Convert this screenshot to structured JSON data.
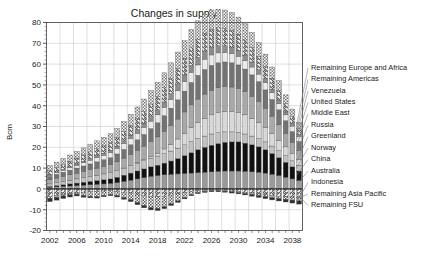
{
  "chart_data": {
    "type": "bar",
    "stacked": true,
    "title": "Changes in supply",
    "xlabel": "",
    "ylabel": "Bcm",
    "ylim": [
      -20,
      80
    ],
    "ytick_step": 10,
    "yticks": [
      "80",
      "70",
      "60",
      "50",
      "40",
      "30",
      "20",
      "10",
      "0",
      "-10",
      "-20"
    ],
    "grid": true,
    "legend_position": "right-callout",
    "categories": [
      "2002",
      "2003",
      "2004",
      "2005",
      "2006",
      "2007",
      "2008",
      "2009",
      "2010",
      "2011",
      "2012",
      "2013",
      "2014",
      "2015",
      "2016",
      "2017",
      "2018",
      "2019",
      "2020",
      "2021",
      "2022",
      "2023",
      "2024",
      "2025",
      "2026",
      "2027",
      "2028",
      "2029",
      "2030",
      "2031",
      "2032",
      "2033",
      "2034",
      "2035",
      "2036",
      "2037",
      "2038",
      "2039"
    ],
    "xtick_labels": [
      "2002",
      "2006",
      "2010",
      "2014",
      "2018",
      "2022",
      "2026",
      "2030",
      "2034",
      "2038"
    ],
    "series": [
      {
        "name": "Remaining FSU",
        "fill": "hatch-diag-up",
        "values": [
          -3.5,
          -3.2,
          -2.8,
          -2.4,
          -2.0,
          -1.6,
          -1.4,
          -1.2,
          -1.0,
          -0.9,
          -1.2,
          -1.6,
          -2.0,
          -2.6,
          -3.2,
          -3.6,
          -3.8,
          -3.6,
          -3.0,
          -2.4,
          -1.8,
          -1.2,
          -0.8,
          -0.6,
          -0.5,
          -0.6,
          -0.8,
          -1.0,
          -1.3,
          -1.6,
          -2.0,
          -2.4,
          -2.8,
          -3.2,
          -3.5,
          -3.8,
          -4.0,
          -4.2
        ]
      },
      {
        "name": "Remaining Asia Pacific",
        "fill": "hatch-check",
        "values": [
          -1.0,
          -0.8,
          -0.6,
          -0.5,
          -0.5,
          -1.6,
          -2.2,
          -2.6,
          -2.2,
          -1.8,
          -2.0,
          -2.6,
          -3.2,
          -4.0,
          -4.8,
          -5.4,
          -5.6,
          -5.0,
          -4.2,
          -3.4,
          -2.4,
          -1.6,
          -1.0,
          -0.6,
          -0.4,
          -0.3,
          -0.3,
          -0.4,
          -0.5,
          -0.6,
          -0.7,
          -0.8,
          -0.9,
          -1.0,
          -1.1,
          -1.2,
          -1.4,
          -1.6
        ]
      },
      {
        "name": "Indonesia",
        "fill": "solid-dark",
        "values": [
          -1.6,
          -1.4,
          -1.2,
          -1.0,
          -0.9,
          -0.8,
          -0.7,
          -0.6,
          -0.6,
          -0.6,
          -0.7,
          -0.8,
          -0.9,
          -1.0,
          -1.1,
          -1.1,
          -1.0,
          -0.9,
          -0.8,
          -0.7,
          -0.6,
          -0.5,
          -0.5,
          -0.5,
          -0.5,
          -0.5,
          -0.5,
          -0.6,
          -0.6,
          -0.7,
          -0.8,
          -0.9,
          -1.0,
          -1.1,
          -1.2,
          -1.3,
          -1.4,
          -1.5
        ]
      },
      {
        "name": "Australia",
        "fill": "gray-62",
        "values": [
          0.8,
          1.0,
          1.2,
          1.4,
          1.6,
          1.8,
          2.0,
          2.2,
          2.4,
          2.6,
          3.0,
          3.6,
          4.2,
          4.8,
          5.4,
          6.0,
          6.4,
          6.8,
          7.0,
          7.2,
          7.4,
          7.6,
          7.8,
          8.0,
          8.2,
          8.4,
          8.6,
          8.6,
          8.6,
          8.4,
          8.2,
          8.0,
          7.6,
          7.0,
          6.4,
          5.6,
          4.8,
          4.0
        ]
      },
      {
        "name": "China",
        "fill": "black",
        "values": [
          0.4,
          0.6,
          0.8,
          1.0,
          1.2,
          1.4,
          1.6,
          1.8,
          2.0,
          2.2,
          2.6,
          3.0,
          3.4,
          3.8,
          4.2,
          4.6,
          5.0,
          5.6,
          6.4,
          7.4,
          8.6,
          9.8,
          11.0,
          12.0,
          12.8,
          13.4,
          13.8,
          14.0,
          14.0,
          13.6,
          13.0,
          12.2,
          11.2,
          10.0,
          8.6,
          7.2,
          5.8,
          4.6
        ]
      },
      {
        "name": "Norway",
        "fill": "gray-80",
        "values": [
          1.2,
          1.4,
          1.6,
          1.8,
          2.0,
          2.2,
          2.4,
          2.6,
          2.8,
          3.0,
          3.2,
          3.4,
          3.6,
          3.8,
          4.0,
          4.2,
          4.4,
          4.6,
          4.8,
          5.0,
          5.2,
          5.4,
          5.4,
          5.4,
          5.4,
          5.2,
          5.0,
          4.8,
          4.6,
          4.4,
          4.2,
          4.0,
          3.8,
          3.6,
          3.4,
          3.2,
          3.0,
          2.8
        ]
      },
      {
        "name": "Greenland",
        "fill": "gray-88",
        "values": [
          0.0,
          0.0,
          0.0,
          0.0,
          0.0,
          0.0,
          0.0,
          0.0,
          0.0,
          0.0,
          0.0,
          0.0,
          0.0,
          0.2,
          0.4,
          0.8,
          1.4,
          2.2,
          3.2,
          4.4,
          5.6,
          6.8,
          7.8,
          8.6,
          9.2,
          9.6,
          9.8,
          9.8,
          9.6,
          9.2,
          8.6,
          7.8,
          7.0,
          6.0,
          5.0,
          4.2,
          3.4,
          2.8
        ]
      },
      {
        "name": "Russia",
        "fill": "gray-70",
        "values": [
          2.0,
          2.2,
          2.4,
          2.6,
          2.8,
          3.0,
          3.2,
          3.4,
          3.6,
          3.8,
          4.2,
          4.8,
          5.4,
          6.0,
          6.6,
          7.2,
          7.8,
          8.4,
          9.0,
          9.6,
          10.2,
          10.8,
          11.2,
          11.6,
          11.8,
          12.0,
          12.0,
          11.8,
          11.6,
          11.2,
          10.6,
          10.0,
          9.2,
          8.4,
          7.4,
          6.4,
          5.4,
          4.4
        ]
      },
      {
        "name": "Middle East",
        "fill": "gray-45",
        "values": [
          1.6,
          1.8,
          2.0,
          2.2,
          2.4,
          2.6,
          2.8,
          3.0,
          3.2,
          3.4,
          3.8,
          4.2,
          4.6,
          5.0,
          5.6,
          6.2,
          6.8,
          7.6,
          8.4,
          9.2,
          10.0,
          10.8,
          11.4,
          11.8,
          12.0,
          12.0,
          11.8,
          11.6,
          11.2,
          10.8,
          10.2,
          9.6,
          8.8,
          8.0,
          7.2,
          6.2,
          5.2,
          4.2
        ]
      },
      {
        "name": "United States",
        "fill": "gray-92",
        "values": [
          0.6,
          0.8,
          1.0,
          1.2,
          1.4,
          1.6,
          1.8,
          2.0,
          2.2,
          2.4,
          2.6,
          2.8,
          3.0,
          3.2,
          3.4,
          3.6,
          3.8,
          4.0,
          4.2,
          4.4,
          4.6,
          4.8,
          5.0,
          5.0,
          5.0,
          4.8,
          4.6,
          4.4,
          4.2,
          4.0,
          3.8,
          3.6,
          3.4,
          3.2,
          3.0,
          2.8,
          2.6,
          2.4
        ]
      },
      {
        "name": "Venezuela",
        "fill": "gray-58",
        "values": [
          0.2,
          0.3,
          0.4,
          0.5,
          0.6,
          0.7,
          0.8,
          0.9,
          1.0,
          1.1,
          1.2,
          1.4,
          1.6,
          1.8,
          2.0,
          2.2,
          2.4,
          2.6,
          2.8,
          3.0,
          3.2,
          3.4,
          3.6,
          3.6,
          3.6,
          3.4,
          3.2,
          3.0,
          2.8,
          2.6,
          2.4,
          2.2,
          2.0,
          1.8,
          1.6,
          1.4,
          1.2,
          1.0
        ]
      },
      {
        "name": "Remaining Americas",
        "fill": "hatch-diag-dn",
        "values": [
          2.0,
          2.2,
          2.4,
          2.6,
          2.8,
          3.0,
          3.2,
          3.4,
          3.6,
          3.8,
          4.0,
          4.4,
          4.8,
          5.2,
          5.6,
          6.0,
          6.4,
          6.8,
          7.2,
          7.6,
          8.0,
          8.4,
          8.6,
          8.8,
          8.8,
          8.6,
          8.4,
          8.2,
          7.8,
          7.4,
          7.0,
          6.4,
          5.8,
          5.2,
          4.6,
          4.0,
          3.4,
          2.8
        ]
      },
      {
        "name": "Remaining Europe and Africa",
        "fill": "hatch-check2",
        "values": [
          2.4,
          2.6,
          2.8,
          3.0,
          3.2,
          3.4,
          3.6,
          3.8,
          4.0,
          4.2,
          4.4,
          4.8,
          5.2,
          5.6,
          6.0,
          6.4,
          6.8,
          7.2,
          7.6,
          8.0,
          8.4,
          8.8,
          9.0,
          9.2,
          9.2,
          9.0,
          8.8,
          8.6,
          8.2,
          7.8,
          7.2,
          6.6,
          6.0,
          5.4,
          4.8,
          4.2,
          3.6,
          3.0
        ]
      }
    ],
    "legend_entries": [
      "Remaining Europe and Africa",
      "Remaining Americas",
      "Venezuela",
      "United States",
      "Middle East",
      "Russia",
      "Greenland",
      "Norway",
      "China",
      "Australia",
      "Indonesia",
      "Remaining Asia Pacific",
      "Remaining FSU"
    ]
  }
}
